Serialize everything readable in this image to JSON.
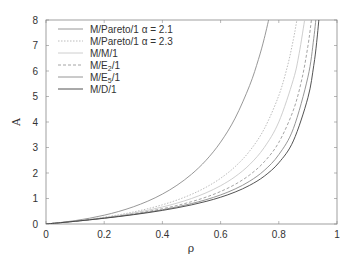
{
  "chart_data": {
    "type": "line",
    "title": "",
    "xlabel": "ρ",
    "ylabel": "A",
    "xlim": [
      0,
      1
    ],
    "ylim": [
      0,
      8
    ],
    "grid": false,
    "legend_position": "upper-left",
    "x_ticks": [
      0,
      0.2,
      0.4,
      0.6,
      0.8,
      1
    ],
    "x_tick_labels": [
      "0",
      "0.2",
      "0.4",
      "0.6",
      "0.8",
      "1"
    ],
    "y_ticks": [
      0,
      1,
      2,
      3,
      4,
      5,
      6,
      7,
      8
    ],
    "y_tick_labels": [
      "0",
      "1",
      "2",
      "3",
      "4",
      "5",
      "6",
      "7",
      "8"
    ],
    "series": [
      {
        "name": "M/Pareto/1 α = 2.1",
        "legend_main": "M/Pareto/1 α = 2.1",
        "legend_sub": "",
        "legend_tail": "",
        "color": "#8c8c8c",
        "dash": "",
        "width": 0.9,
        "x": [
          0,
          0.05,
          0.1,
          0.15,
          0.2,
          0.25,
          0.3,
          0.35,
          0.4,
          0.45,
          0.5,
          0.55,
          0.6,
          0.65,
          0.7,
          0.73,
          0.75,
          0.77
        ],
        "values": [
          0,
          0.058,
          0.132,
          0.227,
          0.345,
          0.492,
          0.673,
          0.897,
          1.173,
          1.518,
          1.95,
          2.499,
          3.21,
          4.151,
          5.437,
          6.454,
          7.275,
          8.25
        ]
      },
      {
        "name": "M/Pareto/1 α = 2.3",
        "legend_main": "M/Pareto/1 α = 2.3",
        "legend_sub": "",
        "legend_tail": "",
        "color": "#b4b4b4",
        "dash": "1.5,1.5",
        "width": 0.9,
        "x": [
          0,
          0.05,
          0.1,
          0.15,
          0.2,
          0.25,
          0.3,
          0.35,
          0.4,
          0.45,
          0.5,
          0.55,
          0.6,
          0.65,
          0.7,
          0.75,
          0.8,
          0.83,
          0.85,
          0.86,
          0.865
        ],
        "values": [
          0,
          0.054,
          0.115,
          0.185,
          0.266,
          0.36,
          0.47,
          0.6,
          0.753,
          0.938,
          1.163,
          1.441,
          1.793,
          2.25,
          2.864,
          3.731,
          5.04,
          6.2,
          7.232,
          7.86,
          8.21
        ]
      },
      {
        "name": "M/M/1",
        "legend_main": "M/M/1",
        "legend_sub": "",
        "legend_tail": "",
        "color": "#c8c8c8",
        "dash": "",
        "width": 0.9,
        "x": [
          0,
          0.05,
          0.1,
          0.15,
          0.2,
          0.25,
          0.3,
          0.35,
          0.4,
          0.45,
          0.5,
          0.55,
          0.6,
          0.65,
          0.7,
          0.75,
          0.8,
          0.85,
          0.87,
          0.89
        ],
        "values": [
          0,
          0.053,
          0.111,
          0.176,
          0.25,
          0.333,
          0.429,
          0.538,
          0.667,
          0.818,
          1.0,
          1.222,
          1.5,
          1.857,
          2.333,
          3.0,
          4.0,
          5.667,
          6.69,
          8.09
        ]
      },
      {
        "name": "M/E2/1",
        "legend_main": "M/E",
        "legend_sub": "2",
        "legend_tail": "/1",
        "color": "#9a9a9a",
        "dash": "3,2",
        "width": 0.9,
        "x": [
          0,
          0.05,
          0.1,
          0.15,
          0.2,
          0.25,
          0.3,
          0.35,
          0.4,
          0.45,
          0.5,
          0.55,
          0.6,
          0.65,
          0.7,
          0.75,
          0.8,
          0.85,
          0.88,
          0.9,
          0.91,
          0.915
        ],
        "values": [
          0,
          0.052,
          0.108,
          0.17,
          0.238,
          0.313,
          0.396,
          0.491,
          0.6,
          0.726,
          0.875,
          1.054,
          1.275,
          1.555,
          1.925,
          2.438,
          3.2,
          4.463,
          5.72,
          6.975,
          7.81,
          8.3
        ]
      },
      {
        "name": "M/E5/1",
        "legend_main": "M/E",
        "legend_sub": "5",
        "legend_tail": "/1",
        "color": "#8a8a8a",
        "dash": "",
        "width": 0.9,
        "x": [
          0,
          0.05,
          0.1,
          0.15,
          0.2,
          0.25,
          0.3,
          0.35,
          0.4,
          0.45,
          0.5,
          0.55,
          0.6,
          0.65,
          0.7,
          0.75,
          0.8,
          0.85,
          0.9,
          0.92,
          0.93
        ],
        "values": [
          0,
          0.052,
          0.107,
          0.166,
          0.23,
          0.3,
          0.377,
          0.463,
          0.56,
          0.671,
          0.8,
          0.953,
          1.14,
          1.374,
          1.68,
          2.1,
          2.72,
          3.74,
          5.76,
          7.27,
          8.34
        ]
      },
      {
        "name": "M/D/1",
        "legend_main": "M/D/1",
        "legend_sub": "",
        "legend_tail": "",
        "color": "#404040",
        "dash": "",
        "width": 0.9,
        "x": [
          0,
          0.05,
          0.1,
          0.15,
          0.2,
          0.25,
          0.3,
          0.35,
          0.4,
          0.45,
          0.5,
          0.55,
          0.6,
          0.65,
          0.7,
          0.75,
          0.8,
          0.85,
          0.9,
          0.92,
          0.93,
          0.94
        ],
        "values": [
          0,
          0.051,
          0.106,
          0.163,
          0.225,
          0.292,
          0.364,
          0.444,
          0.533,
          0.634,
          0.75,
          0.886,
          1.05,
          1.254,
          1.517,
          1.875,
          2.4,
          3.258,
          4.95,
          6.21,
          7.11,
          8.3
        ]
      }
    ]
  }
}
